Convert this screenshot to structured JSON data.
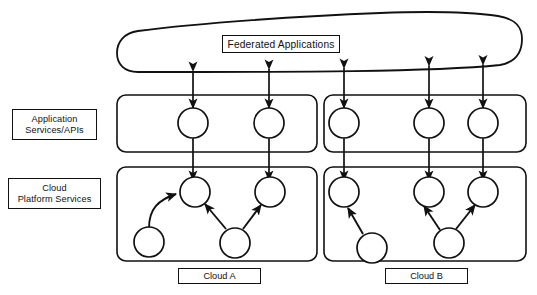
{
  "diagram": {
    "title_label": "Federated Applications",
    "layer_labels": [
      {
        "name": "application-services",
        "line1": "Application",
        "line2": "Services/APIs"
      },
      {
        "name": "cloud-platform-services",
        "line1": "Cloud",
        "line2": "Platform Services"
      }
    ],
    "cloud_tags": [
      {
        "name": "cloud-a-tag",
        "label": "Cloud A"
      },
      {
        "name": "cloud-b-tag",
        "label": "Cloud B"
      }
    ],
    "colors": {
      "stroke": "#111111",
      "background": "#ffffff",
      "node_fill": "#ffffff"
    },
    "clouds": [
      {
        "id": "cloud-a",
        "label": "Cloud A",
        "app_nodes": 2,
        "platform_top_nodes": 2,
        "platform_bottom_nodes": 2
      },
      {
        "id": "cloud-b",
        "label": "Cloud B",
        "app_nodes": 3,
        "platform_top_nodes": 3,
        "platform_bottom_nodes": 2
      }
    ],
    "connections": {
      "federated_to_app": "bidirectional",
      "app_to_platform": "bidirectional",
      "platform_internal": "directional"
    }
  }
}
